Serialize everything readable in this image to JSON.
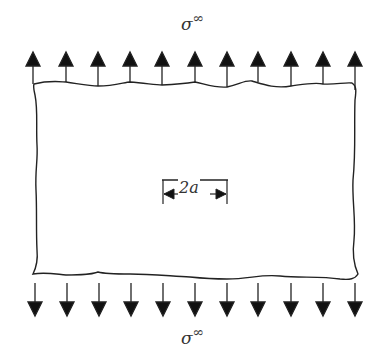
{
  "diagram": {
    "top_load_label": {
      "symbol": "σ",
      "superscript": "∞"
    },
    "bottom_load_label": {
      "symbol": "σ",
      "superscript": "∞"
    },
    "crack_dimension_label": "2a",
    "arrow_count_top": 11,
    "arrow_count_bottom": 11,
    "top_arrow_direction": "up",
    "bottom_arrow_direction": "down",
    "colors": {
      "stroke": "#222222",
      "background": "#ffffff"
    }
  }
}
